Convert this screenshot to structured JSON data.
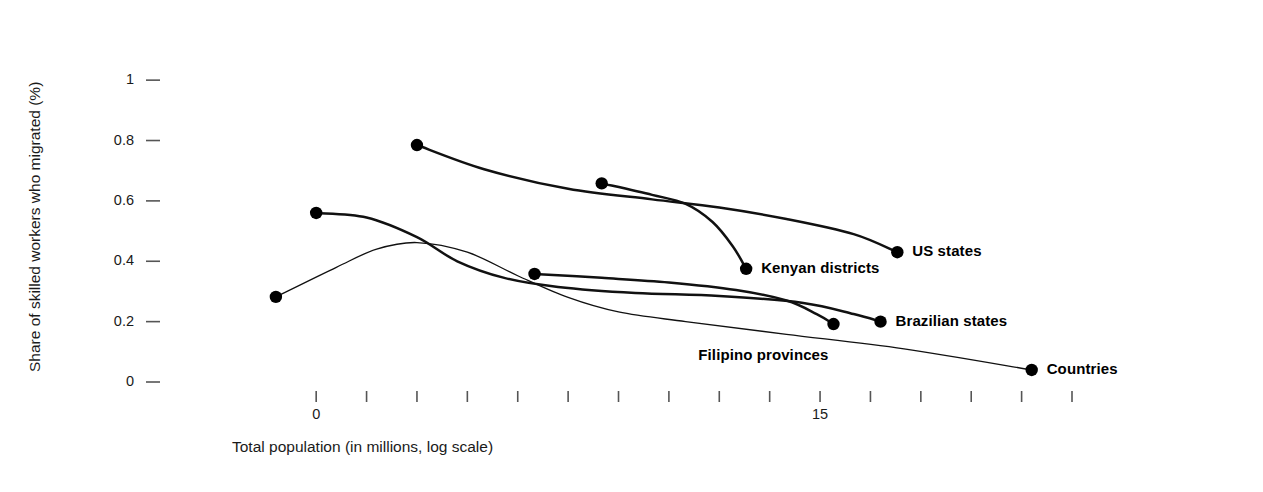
{
  "chart_data": {
    "type": "line",
    "title": "",
    "xlabel": "Total population (in millions, log scale)",
    "ylabel": "Share of skilled workers who migrated (%)",
    "xlim": [
      -2,
      22.5
    ],
    "ylim": [
      0,
      1.08
    ],
    "grid": false,
    "legend_position": "inline-right-of-endpoint",
    "y_ticks": [
      {
        "value": 0,
        "label": "0"
      },
      {
        "value": 0.2,
        "label": "0.2"
      },
      {
        "value": 0.4,
        "label": "0.4"
      },
      {
        "value": 0.6,
        "label": "0.6"
      },
      {
        "value": 0.8,
        "label": "0.8"
      },
      {
        "value": 1,
        "label": "1"
      }
    ],
    "x_ticks": [
      {
        "value": 0,
        "label": "0"
      },
      {
        "value": 1.5,
        "label": ""
      },
      {
        "value": 3,
        "label": ""
      },
      {
        "value": 4.5,
        "label": ""
      },
      {
        "value": 6,
        "label": ""
      },
      {
        "value": 7.5,
        "label": ""
      },
      {
        "value": 9,
        "label": ""
      },
      {
        "value": 10.5,
        "label": ""
      },
      {
        "value": 12,
        "label": ""
      },
      {
        "value": 13.5,
        "label": ""
      },
      {
        "value": 15,
        "label": "15"
      },
      {
        "value": 16.5,
        "label": ""
      },
      {
        "value": 18,
        "label": ""
      },
      {
        "value": 19.5,
        "label": ""
      },
      {
        "value": 21,
        "label": ""
      },
      {
        "value": 22.5,
        "label": ""
      }
    ],
    "series": [
      {
        "name": "US states",
        "label": "US states",
        "line_weight": "bold",
        "points": [
          {
            "x": 3.0,
            "y": 0.785
          },
          {
            "x": 5.0,
            "y": 0.705
          },
          {
            "x": 7.5,
            "y": 0.64
          },
          {
            "x": 10.0,
            "y": 0.605
          },
          {
            "x": 12.0,
            "y": 0.578
          },
          {
            "x": 14.0,
            "y": 0.54
          },
          {
            "x": 16.0,
            "y": 0.49
          },
          {
            "x": 17.3,
            "y": 0.43
          }
        ],
        "start_marker": {
          "x": 3.0,
          "y": 0.785
        },
        "end_marker": {
          "x": 17.3,
          "y": 0.43
        },
        "label_position": "right-of-end-marker"
      },
      {
        "name": "Kenyan districts",
        "label": "Kenyan districts",
        "line_weight": "bold",
        "points": [
          {
            "x": 8.5,
            "y": 0.658
          },
          {
            "x": 10.0,
            "y": 0.62
          },
          {
            "x": 11.0,
            "y": 0.59
          },
          {
            "x": 11.8,
            "y": 0.53
          },
          {
            "x": 12.4,
            "y": 0.45
          },
          {
            "x": 12.8,
            "y": 0.375
          }
        ],
        "start_marker": {
          "x": 8.5,
          "y": 0.658
        },
        "end_marker": {
          "x": 12.8,
          "y": 0.375
        },
        "label_position": "right-of-end-marker"
      },
      {
        "name": "Brazilian states",
        "label": "Brazilian states",
        "line_weight": "bold",
        "points": [
          {
            "x": 0.0,
            "y": 0.56
          },
          {
            "x": 1.5,
            "y": 0.545
          },
          {
            "x": 3.0,
            "y": 0.48
          },
          {
            "x": 4.2,
            "y": 0.4
          },
          {
            "x": 5.6,
            "y": 0.345
          },
          {
            "x": 7.2,
            "y": 0.315
          },
          {
            "x": 9.5,
            "y": 0.295
          },
          {
            "x": 12.0,
            "y": 0.285
          },
          {
            "x": 14.5,
            "y": 0.262
          },
          {
            "x": 16.0,
            "y": 0.225
          },
          {
            "x": 16.8,
            "y": 0.2
          }
        ],
        "start_marker": {
          "x": 0.0,
          "y": 0.56
        },
        "end_marker": {
          "x": 16.8,
          "y": 0.2
        },
        "label_position": "right-of-end-marker"
      },
      {
        "name": "Filipino provinces",
        "label": "Filipino provinces",
        "line_weight": "bold",
        "points": [
          {
            "x": 6.5,
            "y": 0.358
          },
          {
            "x": 8.5,
            "y": 0.345
          },
          {
            "x": 10.5,
            "y": 0.33
          },
          {
            "x": 12.5,
            "y": 0.305
          },
          {
            "x": 14.0,
            "y": 0.27
          },
          {
            "x": 14.9,
            "y": 0.225
          },
          {
            "x": 15.4,
            "y": 0.192
          }
        ],
        "start_marker": {
          "x": 6.5,
          "y": 0.358
        },
        "end_marker": {
          "x": 15.4,
          "y": 0.192
        },
        "label_position": "below-left-of-end-marker"
      },
      {
        "name": "Countries",
        "label": "Countries",
        "line_weight": "thin",
        "points": [
          {
            "x": -1.2,
            "y": 0.282
          },
          {
            "x": 0.6,
            "y": 0.38
          },
          {
            "x": 1.8,
            "y": 0.44
          },
          {
            "x": 3.0,
            "y": 0.462
          },
          {
            "x": 4.5,
            "y": 0.43
          },
          {
            "x": 6.0,
            "y": 0.352
          },
          {
            "x": 7.5,
            "y": 0.28
          },
          {
            "x": 9.0,
            "y": 0.232
          },
          {
            "x": 11.0,
            "y": 0.2
          },
          {
            "x": 14.0,
            "y": 0.158
          },
          {
            "x": 17.5,
            "y": 0.11
          },
          {
            "x": 21.3,
            "y": 0.04
          }
        ],
        "start_marker": {
          "x": -1.2,
          "y": 0.282
        },
        "end_marker": {
          "x": 21.3,
          "y": 0.04
        },
        "label_position": "right-of-end-marker"
      }
    ],
    "colors": {
      "line": "#111111",
      "marker": "#000000",
      "text": "#1a1a1a",
      "background": "#ffffff",
      "tick": "#555555"
    }
  }
}
